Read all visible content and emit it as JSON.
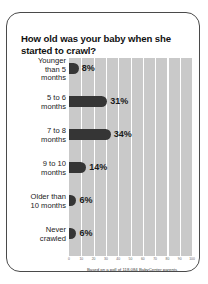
{
  "chart_data": {
    "type": "bar",
    "orientation": "horizontal",
    "title": "How old was your baby when she started to crawl?",
    "categories": [
      "Younger than 5 months",
      "5 to 6 months",
      "7 to 8 months",
      "9 to 10 months",
      "Older than 10 months",
      "Never crawled"
    ],
    "category_lines": [
      [
        "Younger",
        "than 5",
        "months"
      ],
      [
        "5 to 6",
        "months"
      ],
      [
        "7 to 8",
        "months"
      ],
      [
        "9 to 10",
        "months"
      ],
      [
        "Older than",
        "10 months"
      ],
      [
        "Never",
        "crawled"
      ]
    ],
    "values": [
      8,
      31,
      34,
      14,
      6,
      6
    ],
    "value_labels": [
      "8%",
      "31%",
      "34%",
      "14%",
      "6%",
      "6%"
    ],
    "xlabel": "",
    "ylabel": "",
    "xlim": [
      0,
      100
    ],
    "xticks": [
      0,
      10,
      20,
      30,
      40,
      50,
      60,
      70,
      80,
      90,
      100
    ],
    "xtick_labels": [
      "0",
      "10",
      "20",
      "30",
      "40",
      "50",
      "60",
      "70",
      "80",
      "90",
      "100"
    ],
    "grid": true,
    "legend": "none",
    "bar_color": "#353535",
    "plot_bg_color": "#c9c9c9",
    "gridline_color": "#ffffff"
  },
  "footer": {
    "source_note": "Based on a poll of 118,084 BabyCenter parents"
  }
}
